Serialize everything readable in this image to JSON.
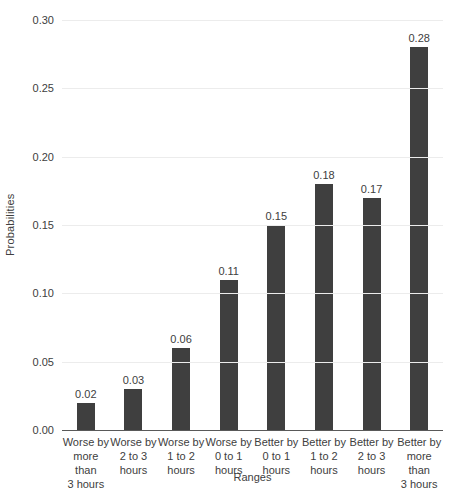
{
  "chart_data": {
    "type": "bar",
    "title": "",
    "xlabel": "Ranges",
    "ylabel": "Probabilities",
    "ylim": [
      0,
      0.3
    ],
    "yticks": [
      0,
      0.05,
      0.1,
      0.15,
      0.2,
      0.25,
      0.3
    ],
    "ytick_labels": [
      "0.00",
      "0.05",
      "0.10",
      "0.15",
      "0.20",
      "0.25",
      "0.30"
    ],
    "categories": [
      "Worse by more than 3 hours",
      "Worse by 2 to 3 hours",
      "Worse by 1 to 2 hours",
      "Worse by 0 to 1 hours",
      "Better by 0 to 1 hours",
      "Better by 1 to 2 hours",
      "Better by 2 to 3 hours",
      "Better by more than 3 hours"
    ],
    "category_label_lines": [
      [
        "Worse by",
        "more than",
        "3 hours"
      ],
      [
        "Worse by",
        "2 to 3",
        "hours"
      ],
      [
        "Worse by",
        "1 to 2",
        "hours"
      ],
      [
        "Worse by",
        "0 to 1",
        "hours"
      ],
      [
        "Better by",
        "0 to 1",
        "hours"
      ],
      [
        "Better by",
        "1 to 2",
        "hours"
      ],
      [
        "Better by",
        "2 to 3",
        "hours"
      ],
      [
        "Better by",
        "more than",
        "3 hours"
      ]
    ],
    "values": [
      0.02,
      0.03,
      0.06,
      0.11,
      0.15,
      0.18,
      0.17,
      0.28
    ],
    "value_labels": [
      "0.02",
      "0.03",
      "0.06",
      "0.11",
      "0.15",
      "0.18",
      "0.17",
      "0.28"
    ],
    "grid": true,
    "legend": false,
    "colors": {
      "bar": "#3f3f3f",
      "gridline": "#ececec",
      "axis_line": "#595959",
      "text": "#404040",
      "background": "#ffffff"
    }
  }
}
